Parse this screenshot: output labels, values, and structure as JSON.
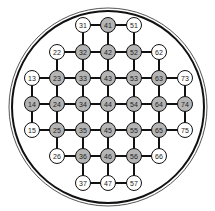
{
  "diagram": {
    "type": "grid-graph-in-circle",
    "circle": {
      "cx": 108,
      "cy": 107,
      "r_outer": 99,
      "r_inner": 96
    },
    "colors": {
      "gray_fill": "#b4b4b4",
      "white_fill": "#ffffff",
      "stroke": "#111111",
      "outer_ring": "#555555"
    },
    "columns_x": {
      "1": 32,
      "2": 57,
      "3": 83,
      "4": 108,
      "5": 134,
      "6": 159,
      "7": 185
    },
    "rows_y": {
      "1": 25,
      "2": 52,
      "3": 78,
      "4": 104,
      "5": 130,
      "6": 156,
      "7": 183
    },
    "nodes": [
      {
        "id": "31",
        "fill": "white"
      },
      {
        "id": "41",
        "fill": "gray"
      },
      {
        "id": "51",
        "fill": "white"
      },
      {
        "id": "22",
        "fill": "white"
      },
      {
        "id": "32",
        "fill": "gray"
      },
      {
        "id": "42",
        "fill": "gray"
      },
      {
        "id": "52",
        "fill": "gray"
      },
      {
        "id": "62",
        "fill": "white"
      },
      {
        "id": "13",
        "fill": "white"
      },
      {
        "id": "23",
        "fill": "gray"
      },
      {
        "id": "33",
        "fill": "gray"
      },
      {
        "id": "43",
        "fill": "gray"
      },
      {
        "id": "53",
        "fill": "gray"
      },
      {
        "id": "63",
        "fill": "gray"
      },
      {
        "id": "73",
        "fill": "white"
      },
      {
        "id": "14",
        "fill": "gray"
      },
      {
        "id": "24",
        "fill": "gray"
      },
      {
        "id": "34",
        "fill": "gray"
      },
      {
        "id": "44",
        "fill": "gray"
      },
      {
        "id": "54",
        "fill": "gray"
      },
      {
        "id": "64",
        "fill": "gray"
      },
      {
        "id": "74",
        "fill": "gray"
      },
      {
        "id": "15",
        "fill": "white"
      },
      {
        "id": "25",
        "fill": "gray"
      },
      {
        "id": "35",
        "fill": "gray"
      },
      {
        "id": "45",
        "fill": "gray"
      },
      {
        "id": "55",
        "fill": "gray"
      },
      {
        "id": "65",
        "fill": "gray"
      },
      {
        "id": "75",
        "fill": "white"
      },
      {
        "id": "26",
        "fill": "white"
      },
      {
        "id": "36",
        "fill": "gray"
      },
      {
        "id": "46",
        "fill": "gray"
      },
      {
        "id": "56",
        "fill": "gray"
      },
      {
        "id": "66",
        "fill": "white"
      },
      {
        "id": "37",
        "fill": "white"
      },
      {
        "id": "47",
        "fill": "white"
      },
      {
        "id": "57",
        "fill": "white"
      }
    ]
  }
}
